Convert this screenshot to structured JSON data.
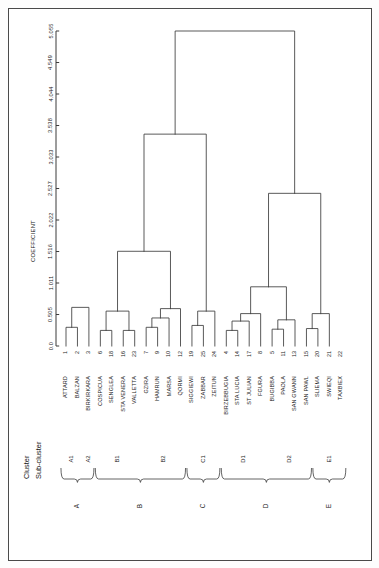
{
  "figure": {
    "headers": {
      "cluster": "Cluster",
      "subcluster": "Sub-cluster"
    },
    "axis_title": "COEFFICIENT"
  },
  "chart_data": {
    "type": "dendrogram",
    "title": "",
    "xlabel": "COEFFICIENT",
    "ylabel": "",
    "orientation": "horizontal-ticks-top",
    "grid": false,
    "legend": "none",
    "axis_range": [
      0.0,
      5.055
    ],
    "axis_ticks": [
      "0.0",
      "0.505",
      "1.011",
      "1.516",
      "2.022",
      "2.527",
      "3.033",
      "3.538",
      "4.044",
      "4.549",
      "5.055"
    ],
    "axis_tick_values": [
      0.0,
      0.505,
      1.011,
      1.516,
      2.022,
      2.527,
      3.033,
      3.538,
      4.044,
      4.549,
      5.055
    ],
    "leaves": [
      {
        "order": 1,
        "id": 1,
        "name": "ATTARD",
        "sub": "A1",
        "cluster": "A"
      },
      {
        "order": 2,
        "id": 2,
        "name": "BALZAN",
        "sub": "A1",
        "cluster": "A"
      },
      {
        "order": 3,
        "id": 3,
        "name": "BIRKIRKARA",
        "sub": "A2",
        "cluster": "A"
      },
      {
        "order": 4,
        "id": 6,
        "name": "COSPICUA",
        "sub": "B1",
        "cluster": "B"
      },
      {
        "order": 5,
        "id": 18,
        "name": "SENGLEA",
        "sub": "B1",
        "cluster": "B"
      },
      {
        "order": 6,
        "id": 16,
        "name": "STA VENERA",
        "sub": "B1",
        "cluster": "B"
      },
      {
        "order": 7,
        "id": 23,
        "name": "VALLETTA",
        "sub": "B1",
        "cluster": "B"
      },
      {
        "order": 8,
        "id": 7,
        "name": "GZIRA",
        "sub": "B2",
        "cluster": "B"
      },
      {
        "order": 9,
        "id": 9,
        "name": "HAMRUN",
        "sub": "B2",
        "cluster": "B"
      },
      {
        "order": 10,
        "id": 10,
        "name": "MARSA",
        "sub": "B2",
        "cluster": "B"
      },
      {
        "order": 11,
        "id": 12,
        "name": "QORMI",
        "sub": "B2",
        "cluster": "B"
      },
      {
        "order": 12,
        "id": 19,
        "name": "SIGGIEWI",
        "sub": "C1",
        "cluster": "C"
      },
      {
        "order": 13,
        "id": 25,
        "name": "ZABBAR",
        "sub": "C1",
        "cluster": "C"
      },
      {
        "order": 14,
        "id": 24,
        "name": "ZEITUN",
        "sub": "C1",
        "cluster": "C"
      },
      {
        "order": 15,
        "id": 4,
        "name": "BIRZEBBUGIA",
        "sub": "D1",
        "cluster": "D"
      },
      {
        "order": 16,
        "id": 14,
        "name": "STA LUCIA",
        "sub": "D1",
        "cluster": "D"
      },
      {
        "order": 17,
        "id": 17,
        "name": "ST JULIAN",
        "sub": "D1",
        "cluster": "D"
      },
      {
        "order": 18,
        "id": 8,
        "name": "FGURA",
        "sub": "D1",
        "cluster": "D"
      },
      {
        "order": 19,
        "id": 5,
        "name": "BUGIBBA",
        "sub": "D2",
        "cluster": "D"
      },
      {
        "order": 20,
        "id": 11,
        "name": "PAOLA",
        "sub": "D2",
        "cluster": "D"
      },
      {
        "order": 21,
        "id": 13,
        "name": "SAN GWANN",
        "sub": "D2",
        "cluster": "D"
      },
      {
        "order": 22,
        "id": 15,
        "name": "SAN PAWL",
        "sub": "D2",
        "cluster": "D"
      },
      {
        "order": 23,
        "id": 20,
        "name": "SLIEMA",
        "sub": "E1",
        "cluster": "E"
      },
      {
        "order": 24,
        "id": 21,
        "name": "SWIEQI",
        "sub": "E1",
        "cluster": "E"
      },
      {
        "order": 25,
        "id": 22,
        "name": "TAXBIEX",
        "sub": "E1",
        "cluster": "E"
      }
    ],
    "merges": [
      {
        "a": {
          "t": "leaf",
          "i": 1
        },
        "b": {
          "t": "leaf",
          "i": 2
        },
        "h": 0.3,
        "k": 0
      },
      {
        "a": {
          "t": "node",
          "i": 0
        },
        "b": {
          "t": "leaf",
          "i": 3
        },
        "h": 0.62,
        "k": 1
      },
      {
        "a": {
          "t": "leaf",
          "i": 4
        },
        "b": {
          "t": "leaf",
          "i": 5
        },
        "h": 0.25,
        "k": 2
      },
      {
        "a": {
          "t": "leaf",
          "i": 6
        },
        "b": {
          "t": "leaf",
          "i": 7
        },
        "h": 0.25,
        "k": 3
      },
      {
        "a": {
          "t": "node",
          "i": 2
        },
        "b": {
          "t": "node",
          "i": 3
        },
        "h": 0.56,
        "k": 4
      },
      {
        "a": {
          "t": "leaf",
          "i": 8
        },
        "b": {
          "t": "leaf",
          "i": 9
        },
        "h": 0.3,
        "k": 5
      },
      {
        "a": {
          "t": "node",
          "i": 5
        },
        "b": {
          "t": "leaf",
          "i": 10
        },
        "h": 0.45,
        "k": 6
      },
      {
        "a": {
          "t": "node",
          "i": 6
        },
        "b": {
          "t": "leaf",
          "i": 11
        },
        "h": 0.6,
        "k": 7
      },
      {
        "a": {
          "t": "node",
          "i": 4
        },
        "b": {
          "t": "node",
          "i": 7
        },
        "h": 1.52,
        "k": 8
      },
      {
        "a": {
          "t": "leaf",
          "i": 12
        },
        "b": {
          "t": "leaf",
          "i": 13
        },
        "h": 0.33,
        "k": 9
      },
      {
        "a": {
          "t": "node",
          "i": 9
        },
        "b": {
          "t": "leaf",
          "i": 14
        },
        "h": 0.56,
        "k": 10
      },
      {
        "a": {
          "t": "node",
          "i": 8
        },
        "b": {
          "t": "node",
          "i": 10
        },
        "h": 3.4,
        "k": 11
      },
      {
        "a": {
          "t": "leaf",
          "i": 15
        },
        "b": {
          "t": "leaf",
          "i": 16
        },
        "h": 0.25,
        "k": 12
      },
      {
        "a": {
          "t": "node",
          "i": 12
        },
        "b": {
          "t": "leaf",
          "i": 17
        },
        "h": 0.4,
        "k": 13
      },
      {
        "a": {
          "t": "node",
          "i": 13
        },
        "b": {
          "t": "leaf",
          "i": 18
        },
        "h": 0.52,
        "k": 14
      },
      {
        "a": {
          "t": "leaf",
          "i": 19
        },
        "b": {
          "t": "leaf",
          "i": 20
        },
        "h": 0.27,
        "k": 15
      },
      {
        "a": {
          "t": "node",
          "i": 15
        },
        "b": {
          "t": "leaf",
          "i": 21
        },
        "h": 0.42,
        "k": 16
      },
      {
        "a": {
          "t": "node",
          "i": 14
        },
        "b": {
          "t": "node",
          "i": 16
        },
        "h": 0.95,
        "k": 17
      },
      {
        "a": {
          "t": "leaf",
          "i": 22
        },
        "b": {
          "t": "leaf",
          "i": 23
        },
        "h": 0.28,
        "k": 18
      },
      {
        "a": {
          "t": "node",
          "i": 18
        },
        "b": {
          "t": "leaf",
          "i": 24
        },
        "h": 0.52,
        "k": 19
      },
      {
        "a": {
          "t": "node",
          "i": 17
        },
        "b": {
          "t": "node",
          "i": 19
        },
        "h": 2.45,
        "k": 20
      },
      {
        "a": {
          "t": "node",
          "i": 11
        },
        "b": {
          "t": "node",
          "i": 20
        },
        "h": 5.055,
        "k": 21
      }
    ],
    "subclusters": [
      {
        "label": "A1",
        "from": 1,
        "to": 2
      },
      {
        "label": "A2",
        "from": 3,
        "to": 3
      },
      {
        "label": "B1",
        "from": 4,
        "to": 7
      },
      {
        "label": "B2",
        "from": 8,
        "to": 11
      },
      {
        "label": "C1",
        "from": 12,
        "to": 14
      },
      {
        "label": "D1",
        "from": 15,
        "to": 18
      },
      {
        "label": "D2",
        "from": 19,
        "to": 22
      },
      {
        "label": "E1",
        "from": 23,
        "to": 25
      }
    ],
    "clusters": [
      {
        "label": "A",
        "from": 1,
        "to": 3
      },
      {
        "label": "B",
        "from": 4,
        "to": 11
      },
      {
        "label": "C",
        "from": 12,
        "to": 14
      },
      {
        "label": "D",
        "from": 15,
        "to": 22
      },
      {
        "label": "E",
        "from": 23,
        "to": 25
      }
    ]
  }
}
